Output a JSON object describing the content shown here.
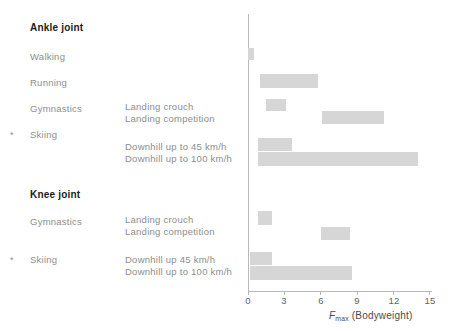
{
  "chart_data": {
    "type": "bar",
    "orientation": "horizontal",
    "title": "",
    "xlabel": "Fmax (Bodyweight)",
    "ylabel": "",
    "xlim": [
      0,
      15.5
    ],
    "xticks": [
      0,
      3,
      6,
      9,
      12,
      15
    ],
    "grid": false,
    "legend": false,
    "bar_color": "#d6d6d6",
    "axis_color": "#b9b9b9",
    "groups": [
      {
        "name": "Ankle joint",
        "rows": [
          {
            "activity": "Walking",
            "condition": "",
            "starred": false,
            "start": 0.0,
            "end": 0.5
          },
          {
            "activity": "Running",
            "condition": "",
            "starred": false,
            "start": 1.0,
            "end": 5.8
          },
          {
            "activity": "Gymnastics",
            "condition": "Landing crouch",
            "starred": false,
            "start": 1.5,
            "end": 3.1
          },
          {
            "activity": "",
            "condition": "Landing competition",
            "starred": false,
            "start": 6.1,
            "end": 11.2
          },
          {
            "activity": "Skiing",
            "condition": "Downhill up to 45 km/h",
            "starred": true,
            "start": 0.8,
            "end": 3.6
          },
          {
            "activity": "",
            "condition": "Downhill up to 100 km/h",
            "starred": false,
            "start": 0.8,
            "end": 14.0
          }
        ]
      },
      {
        "name": "Knee joint",
        "rows": [
          {
            "activity": "Gymnastics",
            "condition": "Landing crouch",
            "starred": false,
            "start": 0.8,
            "end": 2.0
          },
          {
            "activity": "",
            "condition": "Landing competition",
            "starred": false,
            "start": 6.0,
            "end": 8.4
          },
          {
            "activity": "Skiing",
            "condition": "Downhill up 45 km/h",
            "starred": true,
            "start": 0.2,
            "end": 2.0
          },
          {
            "activity": "",
            "condition": "Downhill up to 100 km/h",
            "starred": false,
            "start": 0.2,
            "end": 8.6
          }
        ]
      }
    ]
  },
  "labels": {
    "ankle_group": "Ankle joint",
    "ankle_walking": "Walking",
    "ankle_running": "Running",
    "ankle_gymnastics": "Gymnastics",
    "ankle_skiing": "Skiing",
    "ankle_cond_crouch": "Landing crouch",
    "ankle_cond_comp": "Landing competition",
    "ankle_cond_dh45": "Downhill up to 45 km/h",
    "ankle_cond_dh100": "Downhill up to 100 km/h",
    "knee_group": "Knee joint",
    "knee_gymnastics": "Gymnastics",
    "knee_skiing": "Skiing",
    "knee_cond_crouch": "Landing crouch",
    "knee_cond_comp": "Landing competition",
    "knee_cond_dh45": "Downhill up 45 km/h",
    "knee_cond_dh100": "Downhill up to 100 km/h",
    "star_marker": "*"
  },
  "axis": {
    "t0": "0",
    "t3": "3",
    "t6": "6",
    "t9": "9",
    "t12": "12",
    "t15": "15",
    "title_f": "F",
    "title_sub": "max",
    "title_rest": " (Bodyweight)"
  }
}
